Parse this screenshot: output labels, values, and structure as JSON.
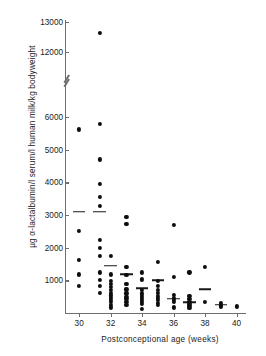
{
  "chart_data": {
    "type": "scatter",
    "title": "",
    "xlabel": "Postconceptional age (weeks)",
    "ylabel": "µg  α-lactalbumin/l serum/l human milk/kg bodyweight",
    "xlim": [
      29.1,
      40.6
    ],
    "xticks": [
      30,
      32,
      34,
      36,
      38,
      40
    ],
    "xticklabels": [
      "30",
      "32",
      "34",
      "36",
      "38",
      "40"
    ],
    "yticks": [
      1000,
      2000,
      3000,
      4000,
      5000,
      6000,
      12000,
      13000
    ],
    "yticklabels": [
      "1000",
      "2000",
      "3000",
      "4000",
      "5000",
      "6000",
      "12000",
      "13000"
    ],
    "axis_break": {
      "present": true,
      "between": [
        6000,
        12000
      ],
      "style": "double-slash"
    },
    "grid": false,
    "legend": null,
    "marker": "filled-circle",
    "points": [
      {
        "x": 30.0,
        "y": 6050
      },
      {
        "x": 30.0,
        "y": 5620
      },
      {
        "x": 30.0,
        "y": 1620
      },
      {
        "x": 30.0,
        "y": 1180
      },
      {
        "x": 30.0,
        "y": 820
      },
      {
        "x": 31.3,
        "y": 12650
      },
      {
        "x": 31.3,
        "y": 5800
      },
      {
        "x": 31.3,
        "y": 4700
      },
      {
        "x": 31.3,
        "y": 3960
      },
      {
        "x": 31.3,
        "y": 3560
      },
      {
        "x": 31.3,
        "y": 3280
      },
      {
        "x": 31.3,
        "y": 2240
      },
      {
        "x": 31.3,
        "y": 2000
      },
      {
        "x": 31.3,
        "y": 1740
      },
      {
        "x": 31.3,
        "y": 1240
      },
      {
        "x": 31.3,
        "y": 1020
      },
      {
        "x": 31.3,
        "y": 830
      },
      {
        "x": 31.3,
        "y": 620
      },
      {
        "x": 32.0,
        "y": 1760
      },
      {
        "x": 32.0,
        "y": 1180
      },
      {
        "x": 32.0,
        "y": 980
      },
      {
        "x": 32.0,
        "y": 880
      },
      {
        "x": 32.0,
        "y": 790
      },
      {
        "x": 32.0,
        "y": 700
      },
      {
        "x": 32.0,
        "y": 620
      },
      {
        "x": 32.0,
        "y": 540
      },
      {
        "x": 32.0,
        "y": 470
      },
      {
        "x": 32.0,
        "y": 400
      },
      {
        "x": 32.0,
        "y": 330
      },
      {
        "x": 32.0,
        "y": 250
      },
      {
        "x": 32.0,
        "y": 170
      },
      {
        "x": 33.0,
        "y": 2940
      },
      {
        "x": 33.0,
        "y": 2730
      },
      {
        "x": 33.0,
        "y": 1420
      },
      {
        "x": 33.0,
        "y": 1160
      },
      {
        "x": 33.0,
        "y": 880
      },
      {
        "x": 33.0,
        "y": 720
      },
      {
        "x": 33.0,
        "y": 600
      },
      {
        "x": 33.0,
        "y": 500
      },
      {
        "x": 33.0,
        "y": 420
      },
      {
        "x": 33.0,
        "y": 340
      },
      {
        "x": 33.0,
        "y": 260
      },
      {
        "x": 34.0,
        "y": 1240
      },
      {
        "x": 34.0,
        "y": 1030
      },
      {
        "x": 34.0,
        "y": 700
      },
      {
        "x": 34.0,
        "y": 600
      },
      {
        "x": 34.0,
        "y": 520
      },
      {
        "x": 34.0,
        "y": 450
      },
      {
        "x": 34.0,
        "y": 390
      },
      {
        "x": 34.0,
        "y": 330
      },
      {
        "x": 34.0,
        "y": 275
      },
      {
        "x": 34.0,
        "y": 120
      },
      {
        "x": 35.0,
        "y": 1560
      },
      {
        "x": 35.0,
        "y": 980
      },
      {
        "x": 35.0,
        "y": 840
      },
      {
        "x": 35.0,
        "y": 700
      },
      {
        "x": 35.0,
        "y": 610
      },
      {
        "x": 35.0,
        "y": 530
      },
      {
        "x": 35.0,
        "y": 460
      },
      {
        "x": 35.0,
        "y": 390
      },
      {
        "x": 35.0,
        "y": 320
      },
      {
        "x": 35.0,
        "y": 250
      },
      {
        "x": 36.0,
        "y": 2700
      },
      {
        "x": 36.0,
        "y": 1100
      },
      {
        "x": 36.0,
        "y": 560
      },
      {
        "x": 36.0,
        "y": 470
      },
      {
        "x": 36.0,
        "y": 410
      },
      {
        "x": 36.0,
        "y": 340
      },
      {
        "x": 36.0,
        "y": 170
      },
      {
        "x": 37.0,
        "y": 1240
      },
      {
        "x": 37.0,
        "y": 520
      },
      {
        "x": 37.0,
        "y": 430
      },
      {
        "x": 37.0,
        "y": 350
      },
      {
        "x": 37.0,
        "y": 280
      },
      {
        "x": 37.0,
        "y": 210
      },
      {
        "x": 37.0,
        "y": 150
      },
      {
        "x": 38.0,
        "y": 1420
      },
      {
        "x": 38.0,
        "y": 340
      },
      {
        "x": 39.0,
        "y": 320
      },
      {
        "x": 39.0,
        "y": 230
      },
      {
        "x": 39.0,
        "y": 180
      },
      {
        "x": 40.0,
        "y": 200
      }
    ],
    "medians": [
      {
        "x_start": 29.6,
        "x_end": 30.4,
        "y": 3100
      },
      {
        "x_start": 30.9,
        "x_end": 31.7,
        "y": 3100
      },
      {
        "x_start": 31.6,
        "x_end": 32.4,
        "y": 1450
      },
      {
        "x_start": 32.6,
        "x_end": 33.4,
        "y": 1180
      },
      {
        "x_start": 33.6,
        "x_end": 34.4,
        "y": 760
      },
      {
        "x_start": 34.6,
        "x_end": 35.4,
        "y": 1000
      },
      {
        "x_start": 35.6,
        "x_end": 36.4,
        "y": 430
      },
      {
        "x_start": 36.6,
        "x_end": 37.4,
        "y": 330
      },
      {
        "x_start": 37.6,
        "x_end": 38.4,
        "y": 720
      },
      {
        "x_start": 38.6,
        "x_end": 39.4,
        "y": 250
      }
    ]
  }
}
